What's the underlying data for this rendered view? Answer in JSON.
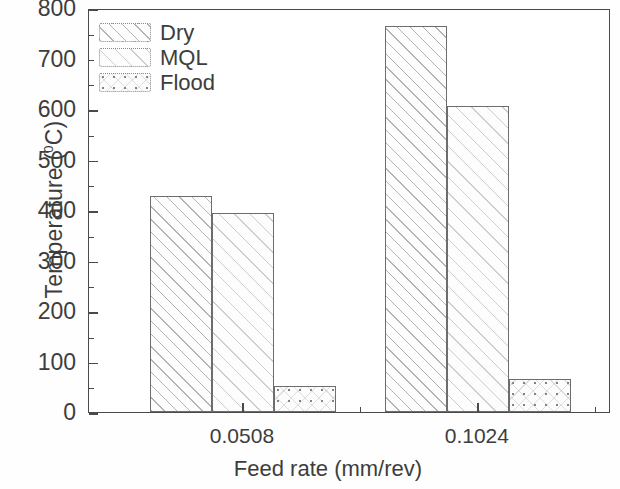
{
  "chart_data": {
    "type": "bar",
    "title": "",
    "subtitle": "",
    "xlabel": "Feed rate (mm/rev)",
    "ylabel": "Temperature (⁰C)",
    "ylabel_text": "Temperature (",
    "ylabel_sup": "0",
    "ylabel_tail": "C)",
    "categories": [
      "0.0508",
      "0.1024"
    ],
    "series": [
      {
        "name": "Dry",
        "values": [
          428,
          765
        ],
        "pattern": "diagonal-hatch"
      },
      {
        "name": "MQL",
        "values": [
          395,
          605
        ],
        "pattern": "light-diagonal-hatch"
      },
      {
        "name": "Flood",
        "values": [
          52,
          65
        ],
        "pattern": "dotted"
      }
    ],
    "ylim": [
      0,
      800
    ],
    "xlim": [
      0,
      1
    ],
    "y_major_ticks": [
      0,
      100,
      200,
      300,
      400,
      500,
      600,
      700,
      800
    ],
    "y_minor_ticks": [
      50,
      150,
      250,
      350,
      450,
      550,
      650,
      750
    ],
    "y_tick_labels": [
      "0",
      "100",
      "200",
      "300",
      "400",
      "500",
      "600",
      "700",
      "800"
    ],
    "x_tick_labels": [
      "0.0508",
      "0.1024"
    ],
    "grid": false,
    "legend_position": "top-left",
    "frame": true,
    "tick_direction": "in",
    "colors": {
      "axis": "#4a4a4a",
      "text": "#3d3d3d",
      "bar_edge": "#6d6d6d",
      "bar_fill": "#fdfdfd",
      "background": "#ffffff"
    }
  },
  "legend": {
    "items": [
      {
        "label": "Dry",
        "swatch": "dry-swatch"
      },
      {
        "label": "MQL",
        "swatch": "mql-swatch"
      },
      {
        "label": "Flood",
        "swatch": "flood-swatch"
      }
    ]
  },
  "axes": {
    "y": {
      "labels": [
        "800",
        "700",
        "600",
        "500",
        "400",
        "300",
        "200",
        "100",
        "0"
      ]
    },
    "x": {
      "labels": [
        "0.0508",
        "0.1024"
      ]
    }
  }
}
